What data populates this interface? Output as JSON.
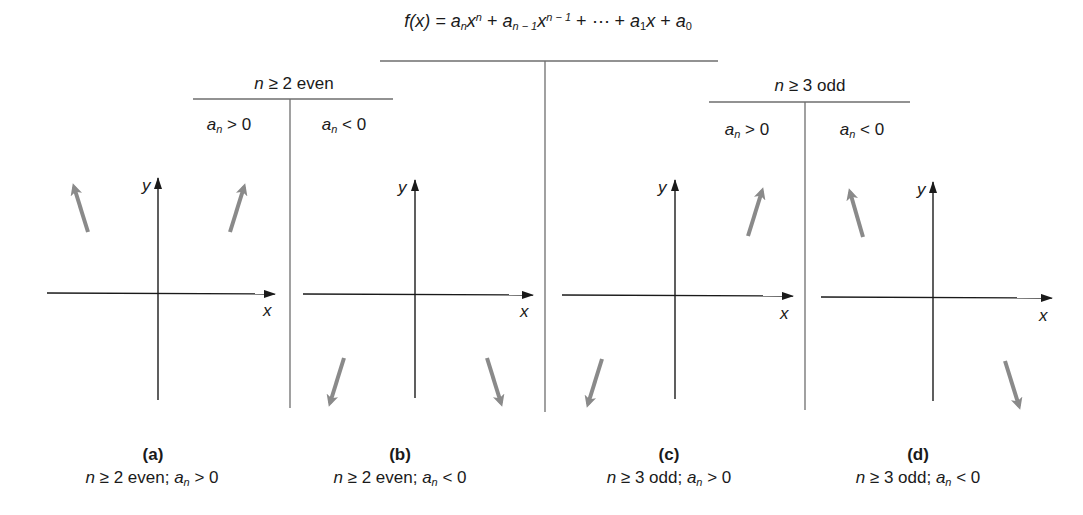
{
  "formula": {
    "lhs": "f(x)",
    "text": "f(x) = a_n x^n + a_{n−1} x^{n−1} + ⋯ + a_1 x + a_0",
    "parts": {
      "f": "f(x) = ",
      "a_n": "a",
      "a_n_sub": "n",
      "x1": "x",
      "x1_sup": "n",
      "plus1": " + ",
      "a_n1": "a",
      "a_n1_sub": "n − 1",
      "x2": "x",
      "x2_sup": "n − 1",
      "dots": " + ⋯ + ",
      "a_1": "a",
      "a_1_sub": "1",
      "x3": "x",
      "plus2": " + ",
      "a_0": "a",
      "a_0_sub": "0"
    }
  },
  "groups": [
    {
      "header": {
        "n": "n",
        "rest": " ≥ 2 even"
      },
      "columns": [
        {
          "a": "a",
          "sub": "n",
          "rel": " > 0"
        },
        {
          "a": "a",
          "sub": "n",
          "rel": " < 0"
        }
      ]
    },
    {
      "header": {
        "n": "n",
        "rest": " ≥ 3 odd"
      },
      "columns": [
        {
          "a": "a",
          "sub": "n",
          "rel": " > 0"
        },
        {
          "a": "a",
          "sub": "n",
          "rel": " < 0"
        }
      ]
    }
  ],
  "panels": [
    {
      "letter": "(a)",
      "n": "n",
      "cond": " ≥ 2 even; ",
      "a": "a",
      "sub": "n",
      "rel": " > 0",
      "x_label": "x",
      "y_label": "y",
      "end_behavior": "up-left, up-right"
    },
    {
      "letter": "(b)",
      "n": "n",
      "cond": " ≥ 2 even; ",
      "a": "a",
      "sub": "n",
      "rel": " < 0",
      "x_label": "x",
      "y_label": "y",
      "end_behavior": "down-left, down-right"
    },
    {
      "letter": "(c)",
      "n": "n",
      "cond": " ≥ 3 odd; ",
      "a": "a",
      "sub": "n",
      "rel": " > 0",
      "x_label": "x",
      "y_label": "y",
      "end_behavior": "down-left, up-right"
    },
    {
      "letter": "(d)",
      "n": "n",
      "cond": " ≥ 3 odd; ",
      "a": "a",
      "sub": "n",
      "rel": " < 0",
      "x_label": "x",
      "y_label": "y",
      "end_behavior": "up-left, down-right"
    }
  ],
  "colors": {
    "axis": "#1a1a1a",
    "divider": "#6e6e6e",
    "arrow": "#8a8a8a"
  }
}
